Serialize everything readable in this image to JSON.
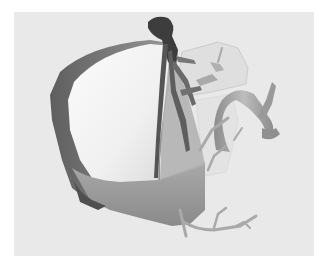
{
  "image": {
    "description": "Grayscale 3D surface rendering of a liver with hepatic and portal vessels on a light gray background",
    "colors": {
      "border": "#ffffff",
      "background": "#e9e9e9",
      "liver_light": "#f6f6f6",
      "liver_mid": "#b5b5b5",
      "liver_dark": "#6e6e6e",
      "vessel_dark": "#4a4a4a",
      "vessel_mid": "#9d9d9d",
      "translucent_segment": "#d8d8d8"
    }
  }
}
